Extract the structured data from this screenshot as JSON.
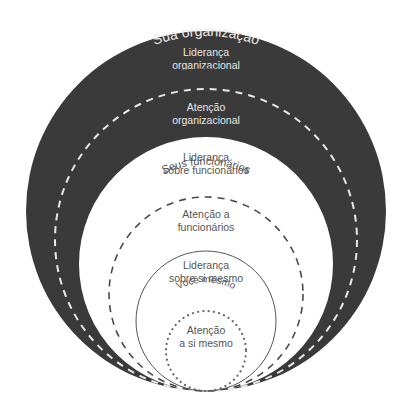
{
  "colors": {
    "background": "#ffffff",
    "outer_fill": "#3a3a3a",
    "inner_fill": "#ffffff",
    "light_text": "#e6e6e6",
    "dark_text": "#5a5a5a",
    "white_dash": "#e8e8e8",
    "dark_dash": "#4a4a4a"
  },
  "rings": {
    "organization": {
      "ring_label": "Sua organização",
      "leadership": [
        "Liderança",
        "organizacional"
      ],
      "attention": [
        "Atenção",
        "organizacional"
      ]
    },
    "employees": {
      "ring_label": "Seus funcionários",
      "leadership": [
        "Liderança",
        "sobre funcionários"
      ],
      "attention": [
        "Atenção a",
        "funcionários"
      ]
    },
    "self": {
      "ring_label": "Você mesmo",
      "leadership": [
        "Liderança",
        "sobre si mesmo"
      ],
      "attention": [
        "Atenção",
        "a si mesmo"
      ]
    }
  }
}
